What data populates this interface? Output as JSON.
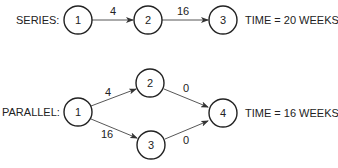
{
  "series": {
    "label": "SERIES:",
    "nodes": [
      "1",
      "2",
      "3"
    ],
    "edges": [
      {
        "from": "1",
        "to": "2",
        "weight": "4"
      },
      {
        "from": "2",
        "to": "3",
        "weight": "16"
      }
    ],
    "result": "TIME = 20 WEEKS"
  },
  "parallel": {
    "label": "PARALLEL:",
    "nodes": [
      "1",
      "2",
      "3",
      "4"
    ],
    "edges": [
      {
        "from": "1",
        "to": "2",
        "weight": "4"
      },
      {
        "from": "1",
        "to": "3",
        "weight": "16"
      },
      {
        "from": "2",
        "to": "4",
        "weight": "0"
      },
      {
        "from": "3",
        "to": "4",
        "weight": "0"
      }
    ],
    "result": "TIME = 16 WEEKS"
  },
  "colors": {
    "stroke": "#222222",
    "background": "#ffffff"
  }
}
